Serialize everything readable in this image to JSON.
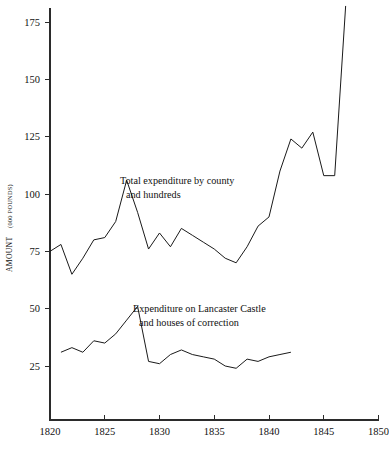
{
  "chart_data": {
    "type": "line",
    "title": "",
    "subtitle": "",
    "xlabel": "",
    "ylabel_main": "AMOUNT",
    "ylabel_unit": "(000 POUNDS)",
    "xlim": [
      1820,
      1850
    ],
    "ylim": [
      0,
      182
    ],
    "grid": false,
    "legend_position": "inline-annotations",
    "x_ticks": [
      "1820",
      "1825",
      "1830",
      "1835",
      "1840",
      "1845",
      "1850"
    ],
    "x_tick_values": [
      1820,
      1825,
      1830,
      1835,
      1840,
      1845,
      1850
    ],
    "y_ticks": [
      "25",
      "50",
      "75",
      "100",
      "125",
      "150",
      "175"
    ],
    "y_tick_values": [
      25,
      50,
      75,
      100,
      125,
      150,
      175
    ],
    "series": [
      {
        "name": "Total expenditure by county and hundreds",
        "label_line1": "Total expenditure by county",
        "label_line2": "and hundreds",
        "color": "#1a1a1a",
        "x": [
          1820,
          1821,
          1822,
          1823,
          1824,
          1825,
          1826,
          1827,
          1828,
          1829,
          1830,
          1831,
          1832,
          1833,
          1834,
          1835,
          1836,
          1837,
          1838,
          1839,
          1840,
          1841,
          1842,
          1843,
          1844,
          1845,
          1846,
          1847
        ],
        "values": [
          75,
          78,
          65,
          72,
          80,
          81,
          88,
          106,
          92,
          76,
          83,
          77,
          85,
          82,
          79,
          76,
          72,
          70,
          77,
          86,
          90,
          110,
          124,
          120,
          127,
          108,
          108,
          182
        ]
      },
      {
        "name": "Expenditure on Lancaster Castle and houses of correction",
        "label_line1": "Expenditure on Lancaster Castle",
        "label_line2": "and houses of correction",
        "color": "#1a1a1a",
        "x": [
          1821,
          1822,
          1823,
          1824,
          1825,
          1826,
          1827,
          1828,
          1829,
          1830,
          1831,
          1832,
          1833,
          1834,
          1835,
          1836,
          1837,
          1838,
          1839,
          1840,
          1841,
          1842
        ],
        "values": [
          31,
          33,
          31,
          36,
          35,
          39,
          45,
          51,
          27,
          26,
          30,
          32,
          30,
          29,
          28,
          25,
          24,
          28,
          27,
          29,
          30,
          31
        ]
      }
    ]
  }
}
